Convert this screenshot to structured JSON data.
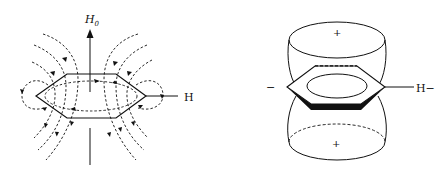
{
  "figure": {
    "left_panel": {
      "title": "Ring current induced field lines",
      "field_label": "H",
      "field_subscript": "0",
      "substituent_label": "H"
    },
    "right_panel": {
      "title": "Shielding cone",
      "top_region_sign": "+",
      "bottom_region_sign": "+",
      "left_region_sign": "−",
      "substituent_label": "H−"
    },
    "colors": {
      "line": "#111111",
      "background": "#ffffff"
    }
  }
}
